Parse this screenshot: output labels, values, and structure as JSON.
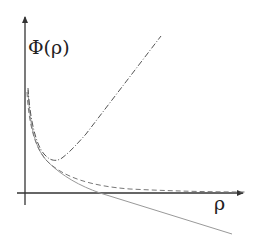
{
  "diagram": {
    "y_axis_label": "Φ(ρ)",
    "x_axis_label": "ρ",
    "colors": {
      "axes": "#333333",
      "dash_dot_curve": "#555555",
      "dashed_curve": "#777777",
      "solid_curve": "#999999"
    },
    "curves": [
      {
        "name": "dash-dot",
        "style": "dash-dot",
        "description": "decays to a minimum then rises linearly"
      },
      {
        "name": "dashed",
        "style": "dashed",
        "description": "decays asymptotically toward zero"
      },
      {
        "name": "solid",
        "style": "solid",
        "description": "decays, crosses zero, then decreases linearly"
      }
    ]
  }
}
